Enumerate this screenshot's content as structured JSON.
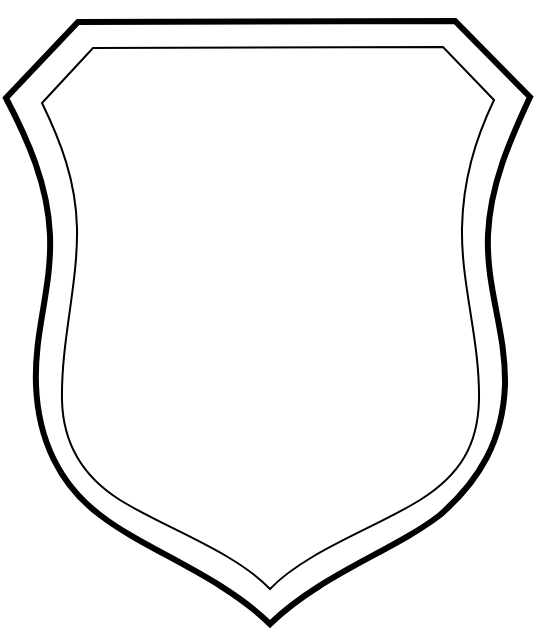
{
  "image": {
    "subject": "blank-shield-outline",
    "background_color": "#ffffff",
    "stroke_color": "#000000"
  },
  "shield": {
    "outer_border": {
      "stroke_width": 6,
      "path": "M78,22 L455,21 L530,97 C510,140 490,185 488,235 C486,290 506,330 505,385 C503,440 480,480 440,515 C395,550 320,575 270,624 C220,575 145,550 100,515 C60,485 38,440 36,385 C34,330 52,290 50,235 C48,185 28,140 6,98 Z"
    },
    "inner_border": {
      "stroke_width": 2,
      "path": "M93,48 L443,47 L494,100 C475,140 463,180 462,228 C461,285 480,340 479,400 C478,445 460,475 420,500 C375,528 305,552 270,589 C235,552 165,528 120,500 C85,478 63,445 62,400 C61,340 78,285 77,228 C76,180 60,140 42,103 Z"
    }
  }
}
